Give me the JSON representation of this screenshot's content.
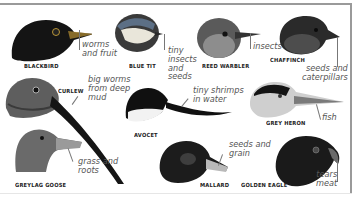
{
  "birds": [
    {
      "name": "BLACKBIRD",
      "diet": "worms\nand fruit"
    },
    {
      "name": "BLUE TIT",
      "diet": "tiny\ninsects\nand\nseeds"
    },
    {
      "name": "REED WARBLER",
      "diet": "insects"
    },
    {
      "name": "CHAFFINCH",
      "diet": "seeds and\ncaterpillars"
    },
    {
      "name": "CURLEW",
      "diet": "big worms\nfrom deep\nmud"
    },
    {
      "name": "AVOCET",
      "diet": "tiny shrimps\nin water"
    },
    {
      "name": "GREY HERON",
      "diet": "fish"
    },
    {
      "name": "GREYLAG GOOSE",
      "diet": "grass and\nroots"
    },
    {
      "name": "MALLARD",
      "diet": "seeds and\ngrain"
    },
    {
      "name": "GOLDEN EAGLE",
      "diet": "tears\nmeat"
    }
  ],
  "colors": {
    "frame": "#9a9a9a",
    "label": "#222222",
    "caption": "#555555"
  }
}
